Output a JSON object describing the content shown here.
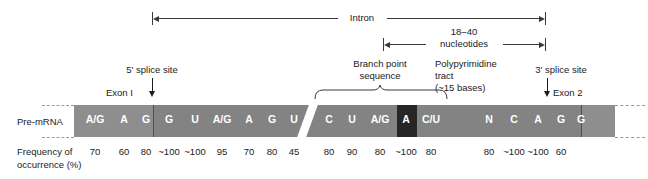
{
  "figure": {
    "row_labels": {
      "pre_mrna": "Pre-mRNA",
      "frequency_line1": "Frequency of",
      "frequency_line2": "occurrence (%)"
    },
    "annotations": {
      "intron": "Intron",
      "nucleotides_count": "18–40",
      "nucleotides_word": "nucleotides",
      "five_prime_splice_site": "5' splice site",
      "three_prime_splice_site": "3' splice site",
      "exon1": "Exon I",
      "exon2": "Exon 2",
      "branch_point_line1": "Branch point",
      "branch_point_line2": "sequence",
      "polypyrimidine_line1": "Polypyrimidine",
      "polypyrimidine_line2": "tract",
      "polypyrimidine_line3": "(~15 bases)"
    },
    "colors": {
      "exon_fill": "#8e8e8e",
      "intron_fill": "#838383",
      "branch_point_fill": "#262626",
      "base_text": "#ffffff",
      "line": "#3a3a3a"
    },
    "sequence": [
      {
        "base": "A/G",
        "freq": "70",
        "x": 95,
        "region": "exon1"
      },
      {
        "base": "A",
        "freq": "60",
        "x": 124,
        "region": "exon1"
      },
      {
        "base": "G",
        "freq": "80",
        "x": 146,
        "region": "exon1"
      },
      {
        "base": "G",
        "freq": "~100",
        "x": 169,
        "region": "intron"
      },
      {
        "base": "U",
        "freq": "~100",
        "x": 195,
        "region": "intron"
      },
      {
        "base": "A/G",
        "freq": "95",
        "x": 222,
        "region": "intron"
      },
      {
        "base": "A",
        "freq": "70",
        "x": 249,
        "region": "intron"
      },
      {
        "base": "G",
        "freq": "80",
        "x": 272,
        "region": "intron"
      },
      {
        "base": "U",
        "freq": "45",
        "x": 294,
        "region": "intron"
      },
      {
        "base": "C",
        "freq": "80",
        "x": 329,
        "region": "intron"
      },
      {
        "base": "U",
        "freq": "90",
        "x": 352,
        "region": "intron"
      },
      {
        "base": "A/G",
        "freq": "80",
        "x": 380,
        "region": "intron"
      },
      {
        "base": "A",
        "freq": "~100",
        "x": 406,
        "region": "branch_point"
      },
      {
        "base": "C/U",
        "freq": "80",
        "x": 431,
        "region": "intron"
      },
      {
        "base": "N",
        "freq": "80",
        "x": 489,
        "region": "intron"
      },
      {
        "base": "C",
        "freq": "~100",
        "x": 514,
        "region": "intron"
      },
      {
        "base": "A",
        "freq": "~100",
        "x": 538,
        "region": "intron"
      },
      {
        "base": "G",
        "freq": "60",
        "x": 561,
        "region": "intron"
      },
      {
        "base": "G",
        "freq": "",
        "x": 581,
        "region": "exon2"
      }
    ]
  }
}
